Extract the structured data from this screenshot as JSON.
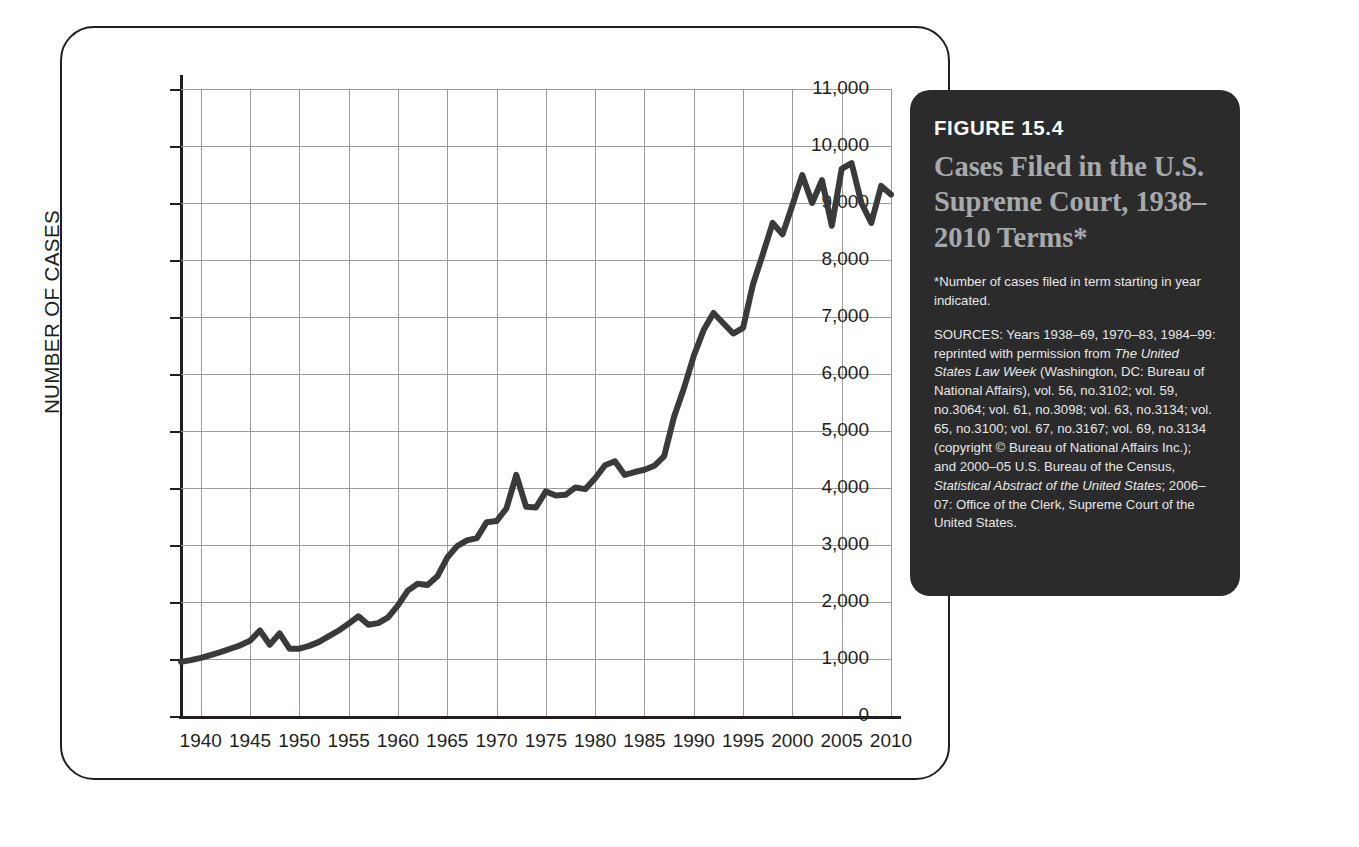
{
  "figure": {
    "number_label": "FIGURE 15.4",
    "title": "Cases Filed in the U.S. Supreme Court, 1938–2010 Terms*",
    "note": "*Number of cases filed in term starting in year indicated.",
    "sources_prefix": "SOURCES: Years 1938–69, 1970–83, 1984–99: reprinted with permission from ",
    "sources_italic_1": "The United States Law Week",
    "sources_mid": " (Washington, DC: Bureau of National Affairs), vol. 56, no.3102; vol. 59, no.3064; vol. 61, no.3098; vol. 63, no.3134; vol. 65, no.3100; vol. 67, no.3167; vol. 69, no.3134 (copyright © Bureau of National Affairs Inc.); and 2000–05 U.S. Bureau of the Census, ",
    "sources_italic_2": "Statistical Abstract of the United States",
    "sources_suffix": "; 2006–07: Office of the Clerk, Supreme Court of the United States."
  },
  "colors": {
    "panel_background": "#2b2b2b",
    "panel_title": "#a7a9ac",
    "panel_heading": "#ffffff",
    "panel_body_text": "#e6e7e8",
    "line": "#3a3a3a",
    "grid": "#9b9b9b",
    "axis": "#231f20",
    "card_border": "#231f20",
    "page_background": "#ffffff"
  },
  "chart_data": {
    "type": "line",
    "title": "Cases Filed in the U.S. Supreme Court, 1938–2010 Terms",
    "xlabel": "",
    "ylabel": "NUMBER OF CASES",
    "xlim": [
      1938,
      2010
    ],
    "ylim": [
      0,
      11000
    ],
    "ytick_values": [
      0,
      1000,
      2000,
      3000,
      4000,
      5000,
      6000,
      7000,
      8000,
      9000,
      10000,
      11000
    ],
    "ytick_labels": [
      "0",
      "1,000",
      "2,000",
      "3,000",
      "4,000",
      "5,000",
      "6,000",
      "7,000",
      "8,000",
      "9,000",
      "10,000",
      "11,000"
    ],
    "xtick_values": [
      1940,
      1945,
      1950,
      1955,
      1960,
      1965,
      1970,
      1975,
      1980,
      1985,
      1990,
      1995,
      2000,
      2005,
      2010
    ],
    "xtick_labels": [
      "1940",
      "1945",
      "1950",
      "1955",
      "1960",
      "1965",
      "1970",
      "1975",
      "1980",
      "1985",
      "1990",
      "1995",
      "2000",
      "2005",
      "2010"
    ],
    "grid": true,
    "legend": "none",
    "series": [
      {
        "name": "Cases filed",
        "x": [
          1938,
          1939,
          1940,
          1941,
          1942,
          1943,
          1944,
          1945,
          1946,
          1947,
          1948,
          1949,
          1950,
          1951,
          1952,
          1953,
          1954,
          1955,
          1956,
          1957,
          1958,
          1959,
          1960,
          1961,
          1962,
          1963,
          1964,
          1965,
          1966,
          1967,
          1968,
          1969,
          1970,
          1971,
          1972,
          1973,
          1974,
          1975,
          1976,
          1977,
          1978,
          1979,
          1980,
          1981,
          1982,
          1983,
          1984,
          1985,
          1986,
          1987,
          1988,
          1989,
          1990,
          1991,
          1992,
          1993,
          1994,
          1995,
          1996,
          1997,
          1998,
          1999,
          2000,
          2001,
          2002,
          2003,
          2004,
          2005,
          2006,
          2007,
          2008,
          2009,
          2010
        ],
        "values": [
          950,
          980,
          1020,
          1070,
          1120,
          1180,
          1240,
          1320,
          1500,
          1250,
          1450,
          1180,
          1180,
          1230,
          1300,
          1400,
          1500,
          1620,
          1750,
          1600,
          1630,
          1730,
          1940,
          2200,
          2320,
          2300,
          2450,
          2780,
          2980,
          3080,
          3120,
          3400,
          3420,
          3640,
          4230,
          3670,
          3660,
          3940,
          3870,
          3880,
          4010,
          3980,
          4170,
          4400,
          4470,
          4230,
          4280,
          4320,
          4390,
          4560,
          5250,
          5750,
          6320,
          6770,
          7070,
          6890,
          6710,
          6810,
          7570,
          8100,
          8650,
          8450,
          8960,
          9490,
          9000,
          9400,
          8600,
          9600,
          9700,
          9000,
          8650,
          9300,
          9150
        ]
      }
    ]
  }
}
